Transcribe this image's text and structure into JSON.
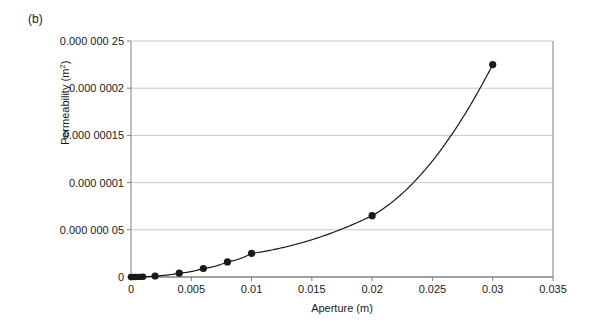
{
  "figure": {
    "panel_label": "(b)",
    "background_color": "#ffffff",
    "axis_color": "#808080",
    "grid_color": "#c8c8c8",
    "series_color": "#1a1a1a"
  },
  "chart_data": {
    "type": "line",
    "title": "",
    "subtitle": "",
    "panel": "(b)",
    "xlabel": "Aperture (m)",
    "ylabel": "Permeability (m2)",
    "ylabel_display": "Permeability (m²)",
    "xlim": [
      0,
      0.035
    ],
    "ylim": [
      0,
      2.5e-07
    ],
    "grid": "horizontal",
    "legend": "none",
    "xticks": [
      0,
      0.005,
      0.01,
      0.015,
      0.02,
      0.025,
      0.03,
      0.035
    ],
    "xtick_labels": [
      "0",
      "0.005",
      "0.01",
      "0.015",
      "0.02",
      "0.025",
      "0.03",
      "0.035"
    ],
    "yticks": [
      0,
      5e-08,
      1e-07,
      1.5e-07,
      2e-07,
      2.5e-07
    ],
    "ytick_labels": [
      "0",
      "0.000 000 05",
      "0.000 0001",
      "0.000 00015",
      "0.000 0002",
      "0.000 000 25"
    ],
    "series": [
      {
        "name": "Permeability",
        "marker": "filled-circle",
        "line": "solid",
        "x": [
          0,
          0.0002,
          0.0004,
          0.0006,
          0.0008,
          0.001,
          0.002,
          0.004,
          0.006,
          0.008,
          0.01,
          0.02,
          0.03
        ],
        "y": [
          0,
          1e-11,
          4e-11,
          9e-11,
          1.6e-10,
          2.5e-10,
          1e-09,
          4e-09,
          9e-09,
          1.6e-08,
          2.5e-08,
          6.5e-08,
          2.25e-07
        ]
      }
    ],
    "annotations": []
  }
}
